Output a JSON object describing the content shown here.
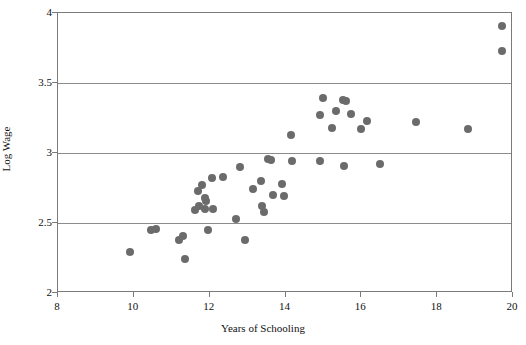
{
  "chart_data": {
    "type": "scatter",
    "title": "",
    "xlabel": "Years of Schooling",
    "ylabel": "Log Wage",
    "xlim": [
      8,
      20
    ],
    "ylim": [
      2,
      4
    ],
    "xticks": [
      8,
      10,
      12,
      14,
      16,
      18,
      20
    ],
    "xtick_labels": [
      "8",
      "10",
      "12",
      "14",
      "16",
      "18",
      "20"
    ],
    "yticks": [
      2,
      2.5,
      3,
      3.5,
      4
    ],
    "ytick_labels": [
      "2",
      "2.5",
      "3",
      "3.5",
      "4"
    ],
    "grid": "horizontal",
    "gridlines_y": [
      2.5,
      3,
      3.5
    ],
    "legend": null,
    "marker": {
      "shape": "circle",
      "color": "#6b6b6b",
      "size_px": 8
    },
    "series": [
      {
        "name": "observations",
        "points": [
          {
            "x": 9.9,
            "y": 2.29
          },
          {
            "x": 10.45,
            "y": 2.45
          },
          {
            "x": 10.58,
            "y": 2.46
          },
          {
            "x": 11.2,
            "y": 2.38
          },
          {
            "x": 11.3,
            "y": 2.41
          },
          {
            "x": 11.35,
            "y": 2.24
          },
          {
            "x": 11.7,
            "y": 2.73
          },
          {
            "x": 11.72,
            "y": 2.62
          },
          {
            "x": 11.8,
            "y": 2.77
          },
          {
            "x": 11.88,
            "y": 2.68
          },
          {
            "x": 11.9,
            "y": 2.66
          },
          {
            "x": 11.88,
            "y": 2.6
          },
          {
            "x": 11.6,
            "y": 2.59
          },
          {
            "x": 11.95,
            "y": 2.45
          },
          {
            "x": 12.05,
            "y": 2.82
          },
          {
            "x": 12.08,
            "y": 2.6
          },
          {
            "x": 12.35,
            "y": 2.83
          },
          {
            "x": 12.7,
            "y": 2.53
          },
          {
            "x": 12.8,
            "y": 2.9
          },
          {
            "x": 12.92,
            "y": 2.38
          },
          {
            "x": 13.15,
            "y": 2.74
          },
          {
            "x": 13.35,
            "y": 2.8
          },
          {
            "x": 13.38,
            "y": 2.62
          },
          {
            "x": 13.42,
            "y": 2.58
          },
          {
            "x": 13.55,
            "y": 2.96
          },
          {
            "x": 13.62,
            "y": 2.95
          },
          {
            "x": 13.68,
            "y": 2.7
          },
          {
            "x": 13.9,
            "y": 2.78
          },
          {
            "x": 13.95,
            "y": 2.69
          },
          {
            "x": 14.15,
            "y": 3.13
          },
          {
            "x": 14.18,
            "y": 2.94
          },
          {
            "x": 14.9,
            "y": 2.94
          },
          {
            "x": 14.92,
            "y": 3.27
          },
          {
            "x": 15.0,
            "y": 3.39
          },
          {
            "x": 15.22,
            "y": 3.18
          },
          {
            "x": 15.32,
            "y": 3.3
          },
          {
            "x": 15.52,
            "y": 3.38
          },
          {
            "x": 15.6,
            "y": 3.37
          },
          {
            "x": 15.72,
            "y": 3.28
          },
          {
            "x": 15.55,
            "y": 2.91
          },
          {
            "x": 16.0,
            "y": 3.17
          },
          {
            "x": 16.15,
            "y": 3.23
          },
          {
            "x": 16.5,
            "y": 2.92
          },
          {
            "x": 17.45,
            "y": 3.22
          },
          {
            "x": 18.8,
            "y": 3.17
          },
          {
            "x": 19.7,
            "y": 3.91
          },
          {
            "x": 19.72,
            "y": 3.73
          }
        ]
      }
    ]
  }
}
